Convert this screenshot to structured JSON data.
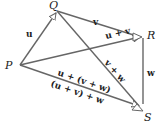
{
  "diagram": {
    "points": {
      "P": {
        "label": "P",
        "x": 20,
        "y": 65
      },
      "Q": {
        "label": "Q",
        "x": 57,
        "y": 11
      },
      "R": {
        "label": "R",
        "x": 143,
        "y": 37
      },
      "S": {
        "label": "S",
        "x": 143,
        "y": 110
      }
    },
    "vectors": [
      {
        "from": "P",
        "to": "Q",
        "label": "u"
      },
      {
        "from": "Q",
        "to": "R",
        "label": "v"
      },
      {
        "from": "P",
        "to": "R",
        "label": "u + v"
      },
      {
        "from": "R",
        "to": "S",
        "label": "w"
      },
      {
        "from": "Q",
        "to": "S",
        "label": "v + w"
      },
      {
        "from": "P",
        "to": "S",
        "label": "u + (v + w)"
      },
      {
        "from": "P",
        "to": "S",
        "label": "(u + v) + w"
      }
    ],
    "colors": {
      "line": "#666666",
      "text": "#222222",
      "background": "#ffffff"
    }
  }
}
